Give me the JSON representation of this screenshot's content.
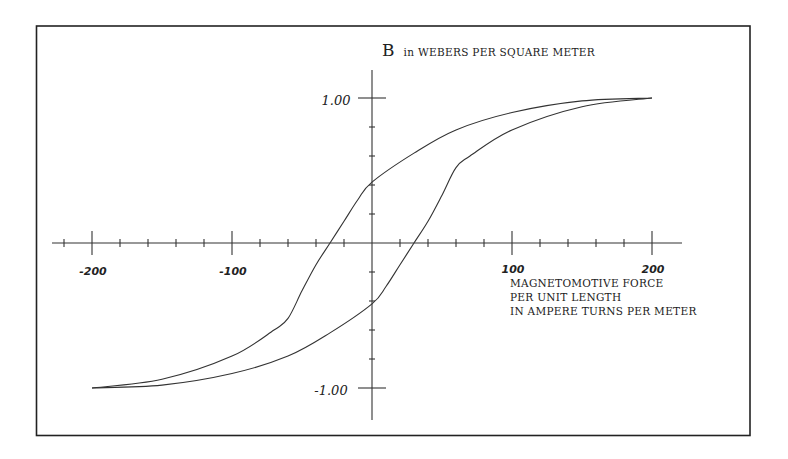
{
  "chart_data": {
    "type": "line",
    "title": "B in WEBERS PER SQUARE METER",
    "xlabel": "MAGNETOMOTIVE FORCE PER UNIT LENGTH IN AMPERE TURNS PER METER",
    "ylabel": "B in WEBERS PER SQUARE METER",
    "xlim": [
      -220,
      220
    ],
    "ylim": [
      -1.1,
      1.1
    ],
    "x_ticks": [
      -200,
      -100,
      100,
      200
    ],
    "x_tick_labels": [
      "-200",
      "-100",
      "100",
      "200"
    ],
    "y_ticks": [
      1.0,
      -1.0
    ],
    "y_tick_labels": [
      "1.00",
      "-1.00"
    ],
    "minor_x_tick_step": 20,
    "minor_y_tick_step": 0.2,
    "grid": false,
    "legend": null,
    "series": [
      {
        "name": "Upper branch (decreasing H)",
        "x": [
          200,
          150,
          100,
          60,
          30,
          0,
          -10,
          -20,
          -30,
          -40,
          -50,
          -60,
          -70,
          -100,
          -150,
          -200
        ],
        "y": [
          1.0,
          0.98,
          0.9,
          0.78,
          0.62,
          0.42,
          0.3,
          0.15,
          0.0,
          -0.15,
          -0.33,
          -0.52,
          -0.6,
          -0.78,
          -0.94,
          -1.0
        ]
      },
      {
        "name": "Lower branch (increasing H)",
        "x": [
          -200,
          -150,
          -100,
          -60,
          -30,
          0,
          10,
          20,
          30,
          40,
          50,
          60,
          70,
          100,
          150,
          200
        ],
        "y": [
          -1.0,
          -0.98,
          -0.9,
          -0.78,
          -0.62,
          -0.42,
          -0.3,
          -0.15,
          0.0,
          0.15,
          0.33,
          0.52,
          0.6,
          0.78,
          0.94,
          1.0
        ]
      }
    ],
    "annotations": {
      "remanence": 0.42,
      "coercive_force": 30,
      "saturation": 1.0
    }
  },
  "labels": {
    "y_axis_title_B": "B",
    "y_axis_title_rest": "in WEBERS PER SQUARE METER",
    "x_axis_title_line1": "MAGNETOMOTIVE FORCE",
    "x_axis_title_line2": "PER UNIT LENGTH",
    "x_axis_title_line3": "IN AMPERE TURNS PER METER",
    "x_tick_neg200": "-200",
    "x_tick_neg100": "-100",
    "x_tick_100": "100",
    "x_tick_200": "200",
    "y_tick_pos1": "1.00",
    "y_tick_neg1": "-1.00"
  }
}
